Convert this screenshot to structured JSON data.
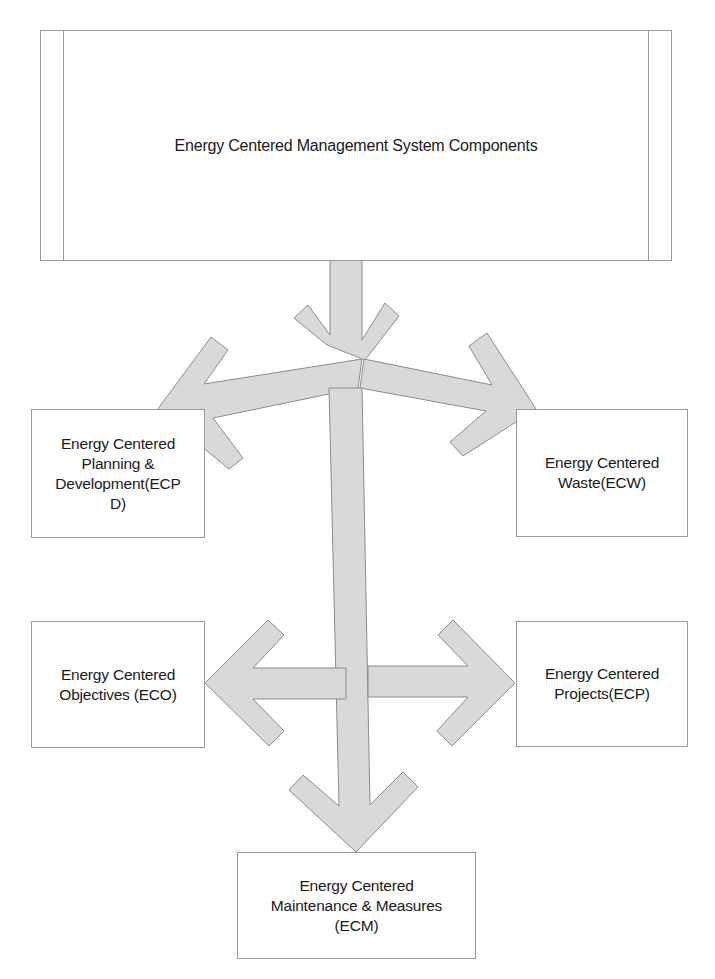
{
  "diagram": {
    "title": "Energy Centered Management System Components",
    "components": {
      "planning": "Energy Centered\nPlanning &\nDevelopment(ECP\nD)",
      "waste": "Energy Centered\nWaste(ECW)",
      "objectives": "Energy Centered\nObjectives (ECO)",
      "projects": "Energy Centered\nProjects(ECP)",
      "maintenance": "Energy Centered\nMaintenance & Measures\n(ECM)"
    },
    "colors": {
      "arrow_fill": "#d9d9d9",
      "arrow_stroke": "#8c8c8c",
      "box_border": "#9a9a9a"
    },
    "edges": [
      {
        "from": "title",
        "to": "junction"
      },
      {
        "from": "junction",
        "to": "planning"
      },
      {
        "from": "junction",
        "to": "waste"
      },
      {
        "from": "junction",
        "to": "maintenance"
      },
      {
        "from": "vertical-shaft",
        "to": "objectives"
      },
      {
        "from": "vertical-shaft",
        "to": "projects"
      }
    ]
  }
}
